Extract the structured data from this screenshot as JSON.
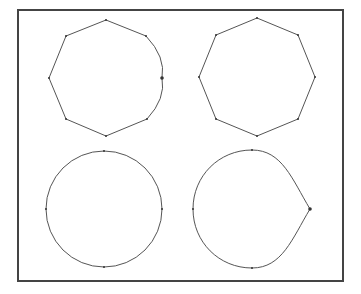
{
  "figure": {
    "frame": {
      "x": 18,
      "y": 10,
      "width": 325,
      "height": 271,
      "stroke": "#444444"
    },
    "stroke_color": "#555555",
    "point_color": "#333333",
    "shapes": [
      {
        "name": "octagon-with-curved-right-side",
        "kind": "polygon",
        "points": [
          [
            106,
            20
          ],
          [
            146,
            36
          ],
          [
            162,
            78
          ],
          [
            147,
            119
          ],
          [
            106,
            136
          ],
          [
            66,
            119
          ],
          [
            49,
            78
          ],
          [
            66,
            36
          ]
        ],
        "highlight_point": [
          162,
          78
        ]
      },
      {
        "name": "regular-octagon",
        "kind": "polygon",
        "points": [
          [
            257,
            18
          ],
          [
            298,
            35
          ],
          [
            315,
            77
          ],
          [
            298,
            119
          ],
          [
            257,
            136
          ],
          [
            216,
            119
          ],
          [
            199,
            77
          ],
          [
            216,
            35
          ]
        ]
      },
      {
        "name": "circle",
        "kind": "circle",
        "center": [
          104,
          209
        ],
        "radius": 58,
        "points": [
          [
            104,
            151
          ],
          [
            162,
            209
          ],
          [
            104,
            267
          ],
          [
            46,
            209
          ]
        ]
      },
      {
        "name": "teardrop",
        "kind": "teardrop",
        "points": [
          [
            252,
            150
          ],
          [
            310,
            209
          ],
          [
            252,
            268
          ],
          [
            193,
            209
          ]
        ],
        "highlight_point": [
          310,
          209
        ]
      }
    ]
  }
}
